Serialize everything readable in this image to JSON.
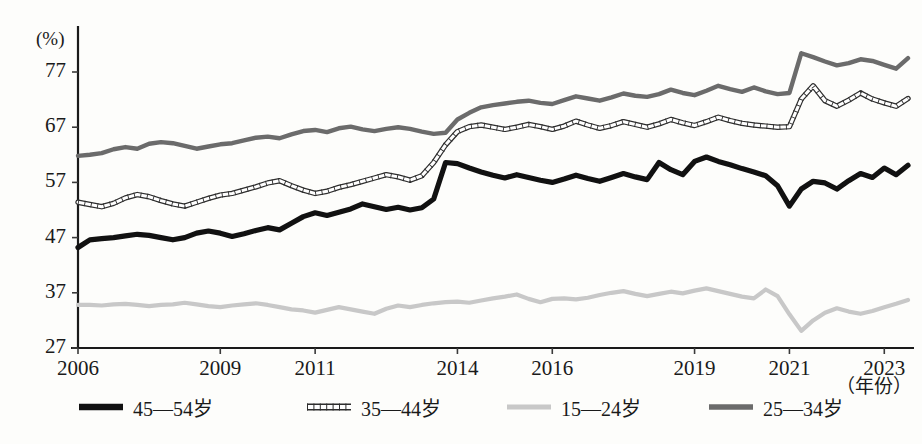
{
  "axis": {
    "y_unit": "(%)",
    "x_title": "（年份）",
    "y_ticks": [
      77,
      67,
      57,
      47,
      37,
      27
    ],
    "x_ticks": [
      2006,
      2009,
      2011,
      2014,
      2016,
      2019,
      2021,
      2023
    ]
  },
  "legend": {
    "items": [
      {
        "label": "45—54岁",
        "style": "thick-black",
        "color": "#111111"
      },
      {
        "label": "35—44岁",
        "style": "chain-outline",
        "color": "#3a3a3a"
      },
      {
        "label": "15—24岁",
        "style": "light-gray",
        "color": "#c8c8c8"
      },
      {
        "label": "25—34岁",
        "style": "dark-gray",
        "color": "#6b6b6b"
      }
    ]
  },
  "chart_data": {
    "type": "line",
    "title": "",
    "subtitle": "",
    "xlabel": "（年份）",
    "ylabel": "(%)",
    "ylim": [
      27,
      82
    ],
    "xlim": [
      2006,
      2023.5
    ],
    "grid": false,
    "legend_position": "bottom",
    "x_axis_note": "quarterly observations, 2006 Q1 through 2023 Q3",
    "x_tick_labels": [
      "2006",
      "2009",
      "2011",
      "2014",
      "2016",
      "2019",
      "2021",
      "2023"
    ],
    "x_tick_values": [
      2006,
      2009,
      2011,
      2014,
      2016,
      2019,
      2021,
      2023
    ],
    "y_tick_labels": [
      "27",
      "37",
      "47",
      "57",
      "67",
      "77"
    ],
    "y_tick_values": [
      27,
      37,
      47,
      57,
      67,
      77
    ],
    "x": [
      2006.0,
      2006.25,
      2006.5,
      2006.75,
      2007.0,
      2007.25,
      2007.5,
      2007.75,
      2008.0,
      2008.25,
      2008.5,
      2008.75,
      2009.0,
      2009.25,
      2009.5,
      2009.75,
      2010.0,
      2010.25,
      2010.5,
      2010.75,
      2011.0,
      2011.25,
      2011.5,
      2011.75,
      2012.0,
      2012.25,
      2012.5,
      2012.75,
      2013.0,
      2013.25,
      2013.5,
      2013.75,
      2014.0,
      2014.25,
      2014.5,
      2014.75,
      2015.0,
      2015.25,
      2015.5,
      2015.75,
      2016.0,
      2016.25,
      2016.5,
      2016.75,
      2017.0,
      2017.25,
      2017.5,
      2017.75,
      2018.0,
      2018.25,
      2018.5,
      2018.75,
      2019.0,
      2019.25,
      2019.5,
      2019.75,
      2020.0,
      2020.25,
      2020.5,
      2020.75,
      2021.0,
      2021.25,
      2021.5,
      2021.75,
      2022.0,
      2022.25,
      2022.5,
      2022.75,
      2023.0,
      2023.25,
      2023.5
    ],
    "series": [
      {
        "name": "25—34岁",
        "color": "#6b6b6b",
        "style": "dark-gray",
        "values": [
          61.8,
          62.0,
          62.3,
          63.0,
          63.4,
          63.1,
          64.0,
          64.3,
          64.1,
          63.6,
          63.1,
          63.5,
          63.9,
          64.1,
          64.6,
          65.1,
          65.3,
          65.0,
          65.7,
          66.3,
          66.5,
          66.1,
          66.8,
          67.1,
          66.6,
          66.3,
          66.7,
          67.0,
          66.7,
          66.2,
          65.8,
          66.0,
          68.4,
          69.6,
          70.6,
          71.0,
          71.3,
          71.6,
          71.8,
          71.4,
          71.2,
          71.9,
          72.6,
          72.2,
          71.8,
          72.4,
          73.1,
          72.7,
          72.5,
          73.0,
          73.8,
          73.2,
          72.8,
          73.6,
          74.5,
          73.9,
          73.4,
          74.2,
          73.5,
          73.0,
          73.2,
          80.4,
          79.7,
          78.9,
          78.2,
          78.6,
          79.3,
          79.0,
          78.3,
          77.6,
          79.5
        ]
      },
      {
        "name": "35—44岁",
        "color": "#3a3a3a",
        "style": "chain-outline",
        "values": [
          53.4,
          53.0,
          52.6,
          53.2,
          54.2,
          54.8,
          54.4,
          53.7,
          53.1,
          52.7,
          53.4,
          54.1,
          54.7,
          55.0,
          55.6,
          56.2,
          56.9,
          57.3,
          56.4,
          55.6,
          55.0,
          55.4,
          56.1,
          56.6,
          57.2,
          57.8,
          58.4,
          58.0,
          57.4,
          58.2,
          60.6,
          63.8,
          66.2,
          67.1,
          67.4,
          67.0,
          66.6,
          67.0,
          67.5,
          67.1,
          66.6,
          67.2,
          68.1,
          67.4,
          66.8,
          67.3,
          68.0,
          67.5,
          67.0,
          67.6,
          68.4,
          67.8,
          67.3,
          68.0,
          68.8,
          68.2,
          67.7,
          67.4,
          67.2,
          67.0,
          67.1,
          72.1,
          74.5,
          71.8,
          70.8,
          71.9,
          73.2,
          72.1,
          71.4,
          70.8,
          72.2
        ]
      },
      {
        "name": "45—54岁",
        "color": "#111111",
        "style": "thick-black",
        "values": [
          45.2,
          46.6,
          46.8,
          47.0,
          47.3,
          47.6,
          47.4,
          47.0,
          46.6,
          47.0,
          47.8,
          48.2,
          47.8,
          47.2,
          47.7,
          48.3,
          48.8,
          48.4,
          49.6,
          50.8,
          51.5,
          51.0,
          51.6,
          52.2,
          53.1,
          52.6,
          52.1,
          52.5,
          52.0,
          52.4,
          54.0,
          60.6,
          60.4,
          59.6,
          58.9,
          58.3,
          57.8,
          58.4,
          57.9,
          57.4,
          57.0,
          57.6,
          58.3,
          57.7,
          57.2,
          57.9,
          58.6,
          58.0,
          57.5,
          60.6,
          59.3,
          58.4,
          60.8,
          61.6,
          60.8,
          60.2,
          59.5,
          58.9,
          58.2,
          56.4,
          52.7,
          55.8,
          57.2,
          56.9,
          55.8,
          57.3,
          58.6,
          57.9,
          59.6,
          58.4,
          60.1
        ]
      },
      {
        "name": "15—24岁",
        "color": "#c8c8c8",
        "style": "light-gray",
        "values": [
          34.8,
          34.8,
          34.7,
          34.9,
          35.0,
          34.8,
          34.6,
          34.8,
          34.9,
          35.2,
          34.9,
          34.6,
          34.4,
          34.7,
          34.9,
          35.1,
          34.8,
          34.4,
          34.0,
          33.8,
          33.4,
          33.9,
          34.4,
          34.0,
          33.6,
          33.2,
          34.1,
          34.7,
          34.4,
          34.8,
          35.1,
          35.3,
          35.4,
          35.2,
          35.6,
          36.0,
          36.3,
          36.7,
          35.9,
          35.3,
          35.9,
          36.0,
          35.8,
          36.1,
          36.6,
          37.0,
          37.3,
          36.8,
          36.4,
          36.8,
          37.2,
          36.9,
          37.4,
          37.8,
          37.3,
          36.8,
          36.3,
          36.0,
          37.6,
          36.4,
          33.1,
          30.1,
          32.0,
          33.4,
          34.2,
          33.6,
          33.2,
          33.7,
          34.4,
          35.0,
          35.7
        ]
      }
    ]
  }
}
